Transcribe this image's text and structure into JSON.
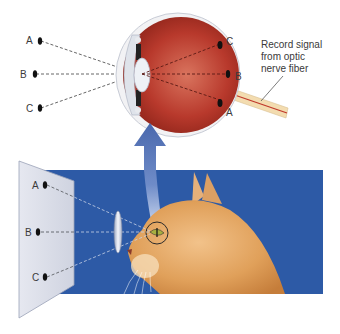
{
  "figure": {
    "top_panel": {
      "object_points": [
        {
          "label": "A"
        },
        {
          "label": "B"
        },
        {
          "label": "C"
        }
      ],
      "retina_points": [
        {
          "label": "C"
        },
        {
          "label": "B"
        },
        {
          "label": "A"
        }
      ],
      "annotation": {
        "lines": [
          "Record signal",
          "from optic",
          "nerve fiber"
        ]
      }
    },
    "bottom_panel": {
      "screen_points": [
        {
          "label": "A"
        },
        {
          "label": "B"
        },
        {
          "label": "C"
        }
      ]
    },
    "colors": {
      "background_blue": "#2d5aa6",
      "eyeball_red": "#b8352a",
      "screen_gray": "#d8dbe6",
      "arrow_blue": "#5a78b8",
      "cat_orange": "#e0a05a",
      "nerve_fiber": "#c0392b"
    }
  }
}
